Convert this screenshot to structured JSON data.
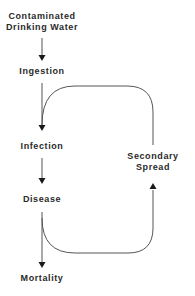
{
  "diagram": {
    "type": "flowchart",
    "colors": {
      "background": "#ffffff",
      "text": "#2a2a2a",
      "line": "#555555",
      "arrowhead": "#1a1a1a"
    },
    "nodes": {
      "source_line1": "Contaminated",
      "source_line2": "Drinking Water",
      "ingestion": "Ingestion",
      "infection": "Infection",
      "disease": "Disease",
      "mortality": "Mortality",
      "secondary_line1": "Secondary",
      "secondary_line2": "Spread"
    },
    "edges": [
      {
        "from": "Contaminated Drinking Water",
        "to": "Ingestion"
      },
      {
        "from": "Ingestion",
        "to": "Infection"
      },
      {
        "from": "Infection",
        "to": "Disease"
      },
      {
        "from": "Disease",
        "to": "Mortality"
      },
      {
        "from": "Disease",
        "to": "Secondary Spread"
      },
      {
        "from": "Secondary Spread",
        "to": "Infection"
      }
    ]
  }
}
